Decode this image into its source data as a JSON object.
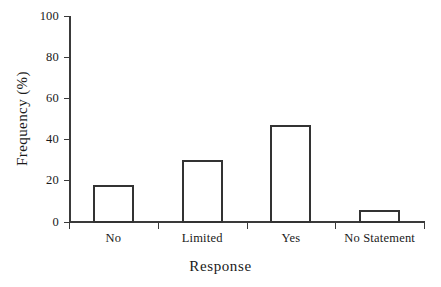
{
  "chart_data": {
    "type": "bar",
    "title": "",
    "xlabel": "Response",
    "ylabel": "Frequency (%)",
    "categories": [
      "No",
      "Limited",
      "Yes",
      "No Statement"
    ],
    "values": [
      18,
      30,
      47,
      6
    ],
    "series": [
      {
        "name": "Frequency",
        "values": [
          18,
          30,
          47,
          6
        ]
      }
    ],
    "ylim": [
      0,
      100
    ],
    "yticks": [
      0,
      20,
      40,
      60,
      80,
      100
    ],
    "ytick_labels": [
      "0",
      "20",
      "40",
      "60",
      "80",
      "100"
    ],
    "xtick_labels": [
      "No",
      "Limited",
      "Yes",
      "No Statement"
    ],
    "grid": false,
    "legend": false,
    "legend_position": "none",
    "bar_style": {
      "fill": "none",
      "edge_color": "#333333",
      "edge_width": 2
    },
    "axis_color": "#3a3a3a",
    "background_color": "#ffffff",
    "text_color": "#1a1a1a"
  }
}
